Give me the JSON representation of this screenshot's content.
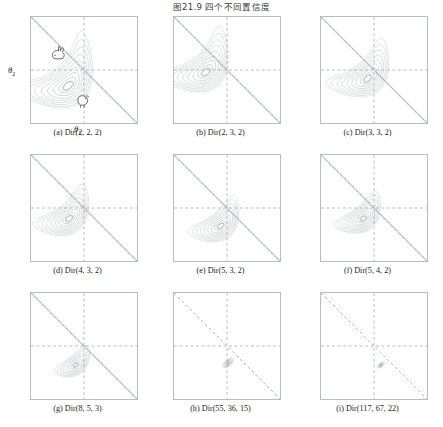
{
  "figure": {
    "title": "图21.9  四个不同置信度",
    "title_number": "图21.9",
    "title_text": "四个不同置信度",
    "type": "contour-grid",
    "rows": 3,
    "cols": 3,
    "frame_color": "#b9bcc4",
    "contour_color": "#8f96a3",
    "dashed_color": "#9aa0ab"
  },
  "axes": {
    "y_label": "θ",
    "y_sub": "2",
    "x_label": "θ",
    "x_sub": "1"
  },
  "icons": {
    "rabbit": "rabbit-icon",
    "chicken": "chicken-icon"
  },
  "panels": [
    {
      "id": "a",
      "caption": "(a) Dir(2, 2, 2)",
      "alpha": [
        2,
        2,
        2
      ],
      "mode_x": 0.35,
      "mode_y": 0.35,
      "spread": 1.0,
      "rings": 9,
      "show_axis_labels": true,
      "show_animals": true
    },
    {
      "id": "b",
      "caption": "(b) Dir(2, 3, 2)",
      "alpha": [
        2,
        3,
        2
      ],
      "mode_x": 0.3,
      "mode_y": 0.48,
      "spread": 0.88,
      "rings": 9,
      "show_axis_labels": false,
      "show_animals": false
    },
    {
      "id": "c",
      "caption": "(c) Dir(3, 3, 2)",
      "alpha": [
        3,
        3,
        2
      ],
      "mode_x": 0.44,
      "mode_y": 0.42,
      "spread": 0.8,
      "rings": 9,
      "show_axis_labels": false,
      "show_animals": false
    },
    {
      "id": "d",
      "caption": "(d) Dir(4, 3, 2)",
      "alpha": [
        4,
        3,
        2
      ],
      "mode_x": 0.36,
      "mode_y": 0.4,
      "spread": 0.72,
      "rings": 9,
      "show_axis_labels": false,
      "show_animals": false
    },
    {
      "id": "e",
      "caption": "(e) Dir(5, 3, 2)",
      "alpha": [
        5,
        3,
        2
      ],
      "mode_x": 0.44,
      "mode_y": 0.33,
      "spread": 0.66,
      "rings": 9,
      "show_axis_labels": false,
      "show_animals": false
    },
    {
      "id": "f",
      "caption": "(f) Dir(5, 4, 2)",
      "alpha": [
        5,
        4,
        2
      ],
      "mode_x": 0.4,
      "mode_y": 0.4,
      "spread": 0.6,
      "rings": 9,
      "show_axis_labels": false,
      "show_animals": false
    },
    {
      "id": "g",
      "caption": "(g) Dir(8, 5, 3)",
      "alpha": [
        8,
        5,
        3
      ],
      "mode_x": 0.42,
      "mode_y": 0.32,
      "spread": 0.46,
      "rings": 8,
      "show_axis_labels": false,
      "show_animals": false
    },
    {
      "id": "h",
      "caption": "(h) Dir(55, 36, 15)",
      "alpha": [
        55,
        36,
        15
      ],
      "mode_x": 0.51,
      "mode_y": 0.34,
      "spread": 0.145,
      "rings": 6,
      "show_axis_labels": false,
      "show_animals": false
    },
    {
      "id": "i",
      "caption": "(i) Dir(117, 67, 22)",
      "alpha": [
        117,
        67,
        22
      ],
      "mode_x": 0.565,
      "mode_y": 0.32,
      "spread": 0.095,
      "rings": 5,
      "show_axis_labels": false,
      "show_animals": false
    }
  ],
  "chart_data": {
    "type": "contour",
    "title": "图21.9  四个不同置信度",
    "xlabel": "θ1",
    "ylabel": "θ2",
    "xlim": [
      0,
      1
    ],
    "ylim": [
      0,
      1
    ],
    "grid": "dashed-midlines-and-antidiagonal",
    "legend": "none",
    "panel_count": 9,
    "series": [
      {
        "name": "(a) Dir(2, 2, 2)",
        "alpha": [
          2,
          2,
          2
        ],
        "mode": [
          0.333,
          0.333
        ],
        "concentration": 6
      },
      {
        "name": "(b) Dir(2, 3, 2)",
        "alpha": [
          2,
          3,
          2
        ],
        "mode": [
          0.25,
          0.5
        ],
        "concentration": 7
      },
      {
        "name": "(c) Dir(3, 3, 2)",
        "alpha": [
          3,
          3,
          2
        ],
        "mode": [
          0.4,
          0.4
        ],
        "concentration": 8
      },
      {
        "name": "(d) Dir(4, 3, 2)",
        "alpha": [
          4,
          3,
          2
        ],
        "mode": [
          0.5,
          0.333
        ],
        "concentration": 9
      },
      {
        "name": "(e) Dir(5, 3, 2)",
        "alpha": [
          5,
          3,
          2
        ],
        "mode": [
          0.571,
          0.286
        ],
        "concentration": 10
      },
      {
        "name": "(f) Dir(5, 4, 2)",
        "alpha": [
          5,
          4,
          2
        ],
        "mode": [
          0.5,
          0.375
        ],
        "concentration": 11
      },
      {
        "name": "(g) Dir(8, 5, 3)",
        "alpha": [
          8,
          5,
          3
        ],
        "mode": [
          0.538,
          0.308
        ],
        "concentration": 16
      },
      {
        "name": "(h) Dir(55, 36, 15)",
        "alpha": [
          55,
          36,
          15
        ],
        "mode": [
          0.519,
          0.337
        ],
        "concentration": 106
      },
      {
        "name": "(i) Dir(117, 67, 22)",
        "alpha": [
          117,
          67,
          22
        ],
        "mode": [
          0.573,
          0.325
        ],
        "concentration": 206
      }
    ]
  }
}
